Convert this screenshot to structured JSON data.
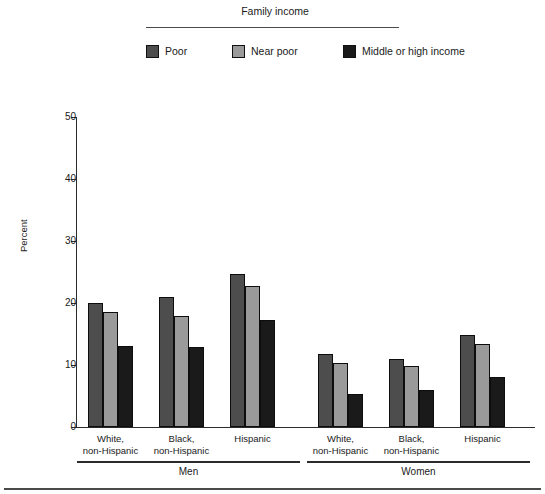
{
  "legend": {
    "title": "Family income",
    "items": [
      {
        "label": "Poor",
        "color": "#4d4d4d",
        "icon": "legend-swatch-poor"
      },
      {
        "label": "Near poor",
        "color": "#9a9a9a",
        "icon": "legend-swatch-near-poor"
      },
      {
        "label": "Middle or high income",
        "color": "#1a1a1a",
        "icon": "legend-swatch-middle-high"
      }
    ]
  },
  "axis": {
    "ylabel": "Percent",
    "yticks": [
      "0",
      "10",
      "20",
      "30",
      "40",
      "50"
    ]
  },
  "supergroups": [
    {
      "label": "Men"
    },
    {
      "label": "Women"
    }
  ],
  "chart_data": {
    "type": "bar",
    "title": "Family income",
    "xlabel": "",
    "ylabel": "Percent",
    "ylim": [
      0,
      50
    ],
    "ytick_step": 10,
    "grid": false,
    "legend_position": "top",
    "supergroups": [
      "Men",
      "Women"
    ],
    "categories": [
      "White, non-Hispanic",
      "Black, non-Hispanic",
      "Hispanic",
      "White, non-Hispanic",
      "Black, non-Hispanic",
      "Hispanic"
    ],
    "category_lines": [
      [
        "White,",
        "non-Hispanic"
      ],
      [
        "Black,",
        "non-Hispanic"
      ],
      [
        "Hispanic",
        ""
      ],
      [
        "White,",
        "non-Hispanic"
      ],
      [
        "Black,",
        "non-Hispanic"
      ],
      [
        "Hispanic",
        ""
      ]
    ],
    "series": [
      {
        "name": "Poor",
        "color": "#4d4d4d",
        "values": [
          20.0,
          21.0,
          24.6,
          11.8,
          11.0,
          14.8
        ]
      },
      {
        "name": "Near poor",
        "color": "#9a9a9a",
        "values": [
          18.5,
          17.9,
          22.8,
          10.3,
          9.8,
          13.4
        ]
      },
      {
        "name": "Middle or high income",
        "color": "#1a1a1a",
        "values": [
          13.0,
          12.9,
          17.2,
          5.3,
          6.0,
          8.0
        ]
      }
    ]
  }
}
